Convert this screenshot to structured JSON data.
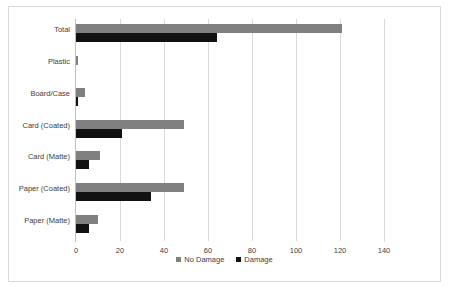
{
  "chart_data": {
    "type": "bar",
    "orientation": "horizontal",
    "title": "",
    "xlabel": "",
    "ylabel": "",
    "xlim": [
      0,
      140
    ],
    "xticks": [
      0,
      20,
      40,
      60,
      80,
      100,
      120,
      140
    ],
    "grid": true,
    "legend_position": "bottom",
    "categories": [
      "Total",
      "Plastic",
      "Board/Case",
      "Card (Coated)",
      "Card (Matte)",
      "Paper (Coated)",
      "Paper (Matte)"
    ],
    "series": [
      {
        "name": "No Damage",
        "color": "#808080",
        "values": [
          121,
          1,
          4,
          49,
          11,
          49,
          10
        ]
      },
      {
        "name": "Damage",
        "color": "#111111",
        "values": [
          64,
          0,
          1,
          21,
          6,
          34,
          6
        ]
      }
    ]
  },
  "legend": {
    "items": [
      {
        "label": "No Damage",
        "color": "#808080"
      },
      {
        "label": "Damage",
        "color": "#111111"
      }
    ]
  }
}
